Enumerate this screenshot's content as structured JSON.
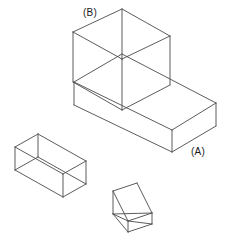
{
  "figure": {
    "kind": "isometric-line-drawing",
    "background_color": "#ffffff",
    "stroke_color": "#4a4a4a",
    "stroke_width": 0.9,
    "labels": [
      {
        "id": "label-a",
        "text": "(A)",
        "x": 191,
        "y": 146,
        "refers_to": "large-stepped-block-base"
      },
      {
        "id": "label-b",
        "text": "(B)",
        "x": 83,
        "y": 7,
        "refers_to": "large-stepped-block-upright"
      }
    ],
    "shapes": [
      {
        "name": "large-stepped-block",
        "description": "Large L-shaped / stepped rectangular solid drawn in isometric wireframe, consisting of a long low base slab (A) with a tall upright box (B) rising from its left end.",
        "faces": [
          {
            "name": "base-top-face",
            "points": "74,82 122,54 216,103 172,130"
          },
          {
            "name": "base-front-face",
            "points": "74,82 74,105 172,152 172,130"
          },
          {
            "name": "base-right-face",
            "points": "172,130 216,103 216,126 172,152"
          },
          {
            "name": "upright-top-face",
            "points": "73,32 122,9 170,36 122,59"
          },
          {
            "name": "upright-front-face",
            "points": "73,32 73,82 122,110 122,59"
          },
          {
            "name": "upright-right-face",
            "points": "122,59 170,36 170,85 122,110"
          }
        ],
        "edges": [
          "73,32 122,9",
          "122,9 170,36",
          "73,32 122,59",
          "122,59 170,36",
          "73,32 73,82",
          "122,9 122,59",
          "170,36 170,85",
          "122,59 122,110",
          "73,82 122,110",
          "122,110 170,85",
          "74,82 122,54",
          "122,54 216,103",
          "74,82 172,130",
          "172,130 216,103",
          "74,82 74,105",
          "216,103 216,126",
          "172,130 172,152",
          "74,105 172,152",
          "172,152 216,126",
          "73,82 74,105"
        ]
      },
      {
        "name": "small-open-box",
        "description": "Small rectangular wireframe box at lower-left of the sheet.",
        "faces": [
          {
            "name": "small-box-top-face",
            "points": "15,147 38,134 86,161 63,174"
          },
          {
            "name": "small-box-front-face",
            "points": "15,147 15,170 63,197 63,174"
          },
          {
            "name": "small-box-right-face",
            "points": "63,174 86,161 86,184 63,197"
          }
        ],
        "edges": [
          "15,147 38,134",
          "38,134 86,161",
          "15,147 63,174",
          "63,174 86,161",
          "15,147 15,170",
          "38,134 38,157",
          "86,161 86,184",
          "63,174 63,197",
          "15,170 63,197",
          "63,197 86,184",
          "38,157 15,170",
          "38,157 86,184"
        ]
      },
      {
        "name": "triangular-prism",
        "description": "Small triangular wedge / prism at bottom-center of the sheet.",
        "faces": [
          {
            "name": "prism-slope-face",
            "points": "113,191 137,183 152,213 128,221"
          },
          {
            "name": "prism-left-face",
            "points": "113,191 113,214 128,232 128,221"
          },
          {
            "name": "prism-bottom-face",
            "points": "113,214 128,232 152,224 152,213"
          }
        ],
        "edges": [
          "113,191 137,183",
          "137,183 152,213",
          "113,191 128,221",
          "128,221 152,213",
          "113,191 113,214",
          "113,214 128,232",
          "128,232 152,224",
          "152,224 152,213",
          "128,221 128,232",
          "113,214 152,213",
          "113,214 128,221",
          "128,221 152,224"
        ]
      }
    ]
  }
}
